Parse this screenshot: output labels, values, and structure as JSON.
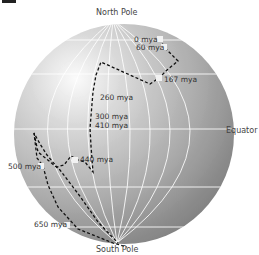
{
  "diagram": {
    "labels": {
      "north_pole": "North Pole",
      "south_pole": "South Pole",
      "equator": "Equator"
    },
    "pole_path_points": [
      {
        "label": "0 mya",
        "x": 160,
        "y": 39
      },
      {
        "label": "60 mya",
        "x": 164,
        "y": 47
      },
      {
        "label": "167 mya",
        "x": 159,
        "y": 78
      },
      {
        "label": "260 mya",
        "x": 97,
        "y": 97
      },
      {
        "label": "300 mya",
        "x": 93,
        "y": 116
      },
      {
        "label": "410 mya",
        "x": 93,
        "y": 125
      },
      {
        "label": "440 mya",
        "x": 74,
        "y": 160
      },
      {
        "label": "500 mya",
        "x": 41,
        "y": 166
      },
      {
        "label": "650 mya",
        "x": 66,
        "y": 225
      }
    ],
    "colors": {
      "sphere_light": "#f4f4f4",
      "sphere_dark": "#8c8c8c",
      "grid": "#ffffff",
      "path": "#111111",
      "marker": "#f2f2f2"
    }
  }
}
